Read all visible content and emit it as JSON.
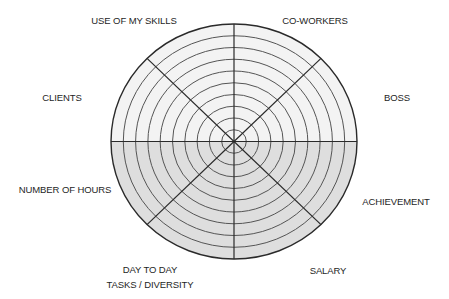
{
  "diagram": {
    "title": "",
    "ring_count": 10,
    "segments": [
      {
        "label": "CO-WORKERS"
      },
      {
        "label": "BOSS"
      },
      {
        "label": "ACHIEVEMENT"
      },
      {
        "label": "SALARY"
      },
      {
        "label": "DAY TO DAY",
        "label2": "TASKS / DIVERSITY"
      },
      {
        "label": "NUMBER OF HOURS"
      },
      {
        "label": "CLIENTS"
      },
      {
        "label": "USE OF MY SKILLS"
      }
    ],
    "colors": {
      "upper_fill": "#f3f3f3",
      "lower_fill": "#dedede",
      "line": "#2a2a2a",
      "ring": "#555555"
    }
  }
}
